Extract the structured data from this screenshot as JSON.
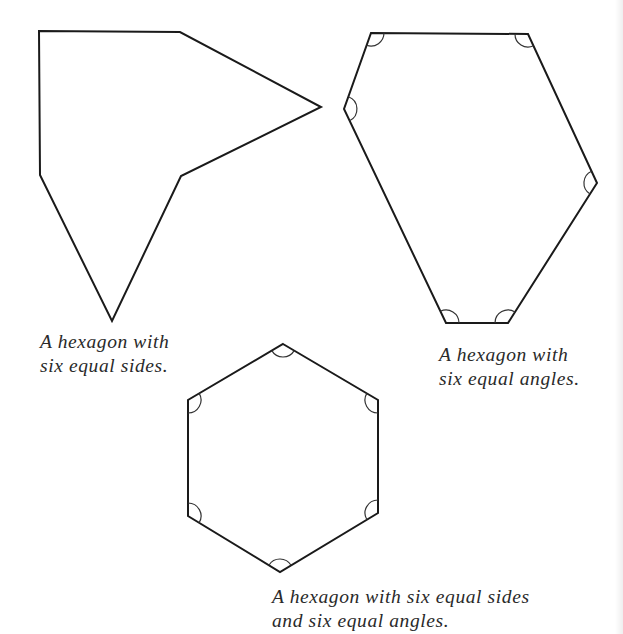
{
  "figures": [
    {
      "id": "irregular-equilateral",
      "caption_line1": "A hexagon with",
      "caption_line2": "six equal sides.",
      "points": [
        [
          39,
          31
        ],
        [
          180,
          32
        ],
        [
          321,
          107
        ],
        [
          181,
          176
        ],
        [
          112,
          321
        ],
        [
          40,
          175
        ]
      ],
      "angle_marks": []
    },
    {
      "id": "equiangular",
      "caption_line1": "A hexagon with",
      "caption_line2": "six equal angles.",
      "points": [
        [
          371,
          33
        ],
        [
          528,
          34
        ],
        [
          597,
          183
        ],
        [
          508,
          323
        ],
        [
          446,
          323
        ],
        [
          344,
          109
        ]
      ],
      "angle_marks": [
        0,
        1,
        2,
        3,
        4,
        5
      ]
    },
    {
      "id": "regular",
      "caption_line1": "A hexagon with six equal sides",
      "caption_line2": "and six equal angles.",
      "points": [
        [
          283,
          344
        ],
        [
          378,
          400
        ],
        [
          378,
          513
        ],
        [
          280,
          572
        ],
        [
          188,
          516
        ],
        [
          188,
          400
        ]
      ],
      "angle_marks": [
        0,
        1,
        2,
        3,
        4,
        5
      ]
    }
  ],
  "style": {
    "stroke_color": "#1a1a1a",
    "arc_color": "#333333",
    "caption_color": "#2a2a2a",
    "background": "#ffffff"
  }
}
